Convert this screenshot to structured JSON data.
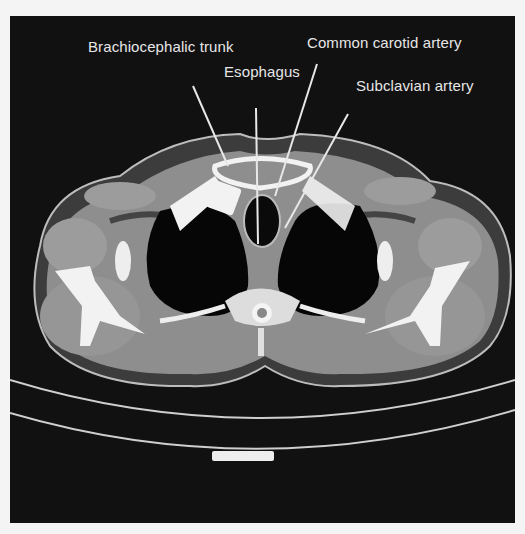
{
  "figure": {
    "type": "axial CT scan of upper thorax",
    "annotations": [
      {
        "id": "brachiocephalic",
        "label": "Brachiocephalic trunk"
      },
      {
        "id": "carotid",
        "label": "Common carotid artery"
      },
      {
        "id": "esophagus",
        "label": "Esophagus"
      },
      {
        "id": "subclavian",
        "label": "Subclavian artery"
      }
    ]
  },
  "colors": {
    "background": "#111111",
    "frame": "#f4f4f4",
    "soft_tissue": "#8c8c8c",
    "muscle": "#9a9a9a",
    "fat": "#3a3a3a",
    "bone": "#f2f2f2",
    "air": "#050505",
    "label_text": "#e6e6e6"
  }
}
